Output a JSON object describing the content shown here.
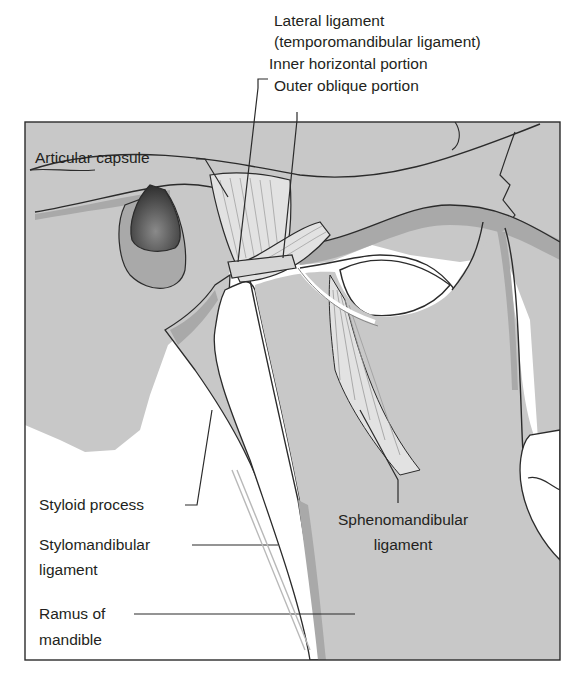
{
  "figure": {
    "colors": {
      "tissue_gray": "#c8c8c8",
      "shadow_gray": "#a9a9a9",
      "ligament_light": "#e2e2e2",
      "cavity_dark": "#3c3c3c",
      "outline": "#2b2b2b",
      "background": "#ffffff"
    },
    "labels": {
      "lateral_ligament_line1": "Lateral ligament",
      "lateral_ligament_line2": "(temporomandibular ligament)",
      "inner_horizontal": "Inner horizontal portion",
      "outer_oblique": "Outer oblique portion",
      "articular_capsule": "Articular capsule",
      "styloid_process": "Styloid process",
      "stylomandibular_line1": "Stylomandibular",
      "stylomandibular_line2": "ligament",
      "ramus_line1": "Ramus of",
      "ramus_line2": "mandible",
      "sphenomandibular_line1": "Sphenomandibular",
      "sphenomandibular_line2": "ligament"
    }
  }
}
